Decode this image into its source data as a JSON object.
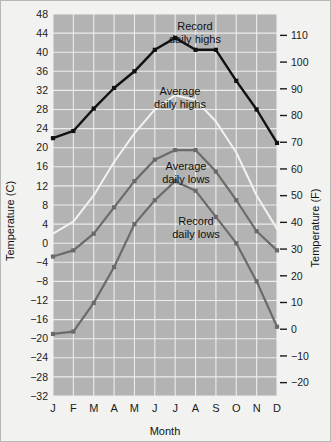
{
  "chart_data": {
    "type": "line",
    "title": "",
    "xlabel": "Month",
    "ylabel": "Temperature (C)",
    "ylabel_right": "Temperature (F)",
    "categories": [
      "J",
      "F",
      "M",
      "A",
      "M",
      "J",
      "J",
      "A",
      "S",
      "O",
      "N",
      "D"
    ],
    "month_labels": [
      "J",
      "F",
      "M",
      "A",
      "M",
      "J",
      "J",
      "A",
      "S",
      "O",
      "N",
      "D"
    ],
    "ylim": [
      -32,
      48
    ],
    "yticks": [
      48,
      44,
      40,
      36,
      32,
      28,
      24,
      20,
      16,
      12,
      8,
      4,
      0,
      -4,
      -8,
      -12,
      -16,
      -20,
      -24,
      -28,
      -32
    ],
    "ytick_labels": [
      "48",
      "44",
      "40",
      "36",
      "32",
      "28",
      "24",
      "20",
      "16",
      "12",
      "8",
      "4",
      "0",
      "-4",
      "-8",
      "-12",
      "-16",
      "-20",
      "-24",
      "-28",
      "-32"
    ],
    "ylim_right": [
      -25,
      118
    ],
    "yticks_right": [
      110,
      100,
      90,
      80,
      70,
      60,
      50,
      40,
      30,
      20,
      10,
      0,
      -10,
      -20
    ],
    "ytick_labels_right": [
      "110",
      "100",
      "90",
      "80",
      "70",
      "60",
      "50",
      "40",
      "30",
      "20",
      "10",
      "0",
      "-10",
      "-20"
    ],
    "grid": true,
    "legend_position": "inline-annotations",
    "plot_bg": "#b3b3b3",
    "grid_color": "#f0f0f0",
    "series": [
      {
        "name": "Record daily highs",
        "color": "#111111",
        "values": [
          22.0,
          23.5,
          28.2,
          32.5,
          36.0,
          40.5,
          43.0,
          40.5,
          40.5,
          34.0,
          28.0,
          21.0
        ]
      },
      {
        "name": "Average daily highs",
        "color": "#f2f2ee",
        "values": [
          2.0,
          4.5,
          10.0,
          17.0,
          23.0,
          28.0,
          31.0,
          30.0,
          25.5,
          19.0,
          10.0,
          3.0
        ]
      },
      {
        "name": "Average daily lows",
        "color": "#6b6b6b",
        "values": [
          -2.8,
          -1.5,
          2.0,
          7.5,
          13.0,
          17.5,
          19.5,
          19.5,
          15.0,
          9.0,
          2.5,
          -1.5
        ]
      },
      {
        "name": "Record daily lows",
        "color": "#6b6b6b",
        "values": [
          -19.0,
          -18.5,
          -12.5,
          -5.0,
          4.0,
          9.0,
          13.0,
          11.0,
          5.5,
          0.0,
          -8.0,
          -17.5
        ]
      }
    ],
    "annotations": [
      {
        "id": "record-highs",
        "line1": "Record",
        "line2": "daily highs"
      },
      {
        "id": "average-highs",
        "line1": "Average",
        "line2": "daily highs"
      },
      {
        "id": "average-lows",
        "line1": "Average",
        "line2": "daily lows"
      },
      {
        "id": "record-lows",
        "line1": "Record",
        "line2": "daily lows"
      }
    ]
  }
}
